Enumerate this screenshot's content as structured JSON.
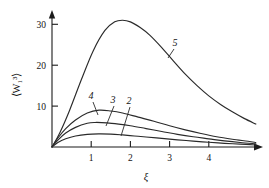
{
  "chart_data": {
    "type": "line",
    "title": "",
    "xlabel": "ξ",
    "ylabel": "⟨W₁³⟩",
    "xlim": [
      0,
      5.2
    ],
    "ylim": [
      0,
      35
    ],
    "grid": false,
    "legend_position": "inline-labels",
    "xticks": [
      1,
      2,
      3,
      4
    ],
    "xtick_labels": [
      "1",
      "2",
      "3",
      "4"
    ],
    "yticks": [
      10,
      20,
      30
    ],
    "ytick_labels": [
      "10",
      "20",
      "30"
    ],
    "series": [
      {
        "name": "2",
        "label": "2",
        "peak_x": 1.35,
        "peak_y": 3.2,
        "x": [
          0,
          0.15,
          0.35,
          0.6,
          0.9,
          1.2,
          1.5,
          1.8,
          2.1,
          2.4,
          2.8,
          3.2,
          3.6,
          4.0,
          4.4,
          4.8,
          5.2
        ],
        "y": [
          0,
          1.1,
          2.0,
          2.7,
          3.1,
          3.2,
          3.15,
          2.95,
          2.7,
          2.45,
          2.1,
          1.75,
          1.45,
          1.15,
          0.9,
          0.7,
          0.5
        ]
      },
      {
        "name": "3",
        "label": "3",
        "peak_x": 1.1,
        "peak_y": 6.0,
        "x": [
          0,
          0.15,
          0.35,
          0.6,
          0.9,
          1.1,
          1.4,
          1.7,
          2.0,
          2.4,
          2.8,
          3.2,
          3.6,
          4.0,
          4.4,
          4.8,
          5.2
        ],
        "y": [
          0,
          1.7,
          3.4,
          4.8,
          5.8,
          6.0,
          5.9,
          5.6,
          5.2,
          4.5,
          3.8,
          3.1,
          2.5,
          2.0,
          1.5,
          1.1,
          0.8
        ]
      },
      {
        "name": "4",
        "label": "4",
        "peak_x": 1.2,
        "peak_y": 9.0,
        "x": [
          0,
          0.15,
          0.35,
          0.6,
          0.9,
          1.2,
          1.5,
          1.8,
          2.2,
          2.6,
          3.0,
          3.4,
          3.8,
          4.2,
          4.6,
          5.0,
          5.2
        ],
        "y": [
          0,
          2.2,
          4.5,
          6.6,
          8.3,
          9.0,
          8.8,
          8.3,
          7.3,
          6.3,
          5.2,
          4.2,
          3.3,
          2.5,
          1.9,
          1.4,
          1.1
        ]
      },
      {
        "name": "5",
        "label": "5",
        "peak_x": 1.8,
        "peak_y": 31.0,
        "x": [
          0,
          0.2,
          0.45,
          0.75,
          1.05,
          1.35,
          1.6,
          1.8,
          2.0,
          2.25,
          2.5,
          2.8,
          3.1,
          3.4,
          3.7,
          4.0,
          4.3,
          4.6,
          4.9,
          5.2
        ],
        "y": [
          0,
          3.5,
          9.0,
          16.5,
          23.5,
          28.5,
          30.6,
          31.0,
          30.6,
          29.2,
          27.3,
          24.3,
          21.0,
          17.8,
          15.0,
          12.5,
          10.4,
          8.6,
          7.0,
          5.6
        ]
      }
    ],
    "curve_labels": [
      {
        "text": "2",
        "lx": 129,
        "ly": 104,
        "leader": [
          [
            130,
            107
          ],
          [
            121,
            136
          ]
        ]
      },
      {
        "text": "3",
        "lx": 113,
        "ly": 103,
        "leader": [
          [
            114,
            106
          ],
          [
            106,
            126
          ]
        ]
      },
      {
        "text": "4",
        "lx": 91,
        "ly": 99,
        "leader": [
          [
            93,
            102
          ],
          [
            98,
            115
          ]
        ]
      },
      {
        "text": "5",
        "lx": 175,
        "ly": 46,
        "leader": [
          [
            174,
            49
          ],
          [
            168,
            58
          ]
        ]
      }
    ],
    "colors": {
      "curve": "#2a2a2a",
      "axis": "#1b1b1b",
      "text": "#141414",
      "background": "#ffffff"
    }
  }
}
